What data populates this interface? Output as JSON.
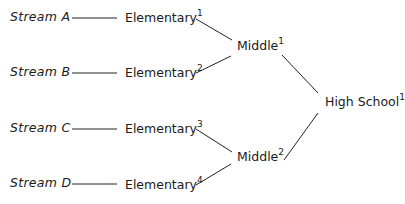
{
  "diagram": {
    "type": "tree",
    "streams": [
      {
        "label": "Stream A"
      },
      {
        "label": "Stream B"
      },
      {
        "label": "Stream C"
      },
      {
        "label": "Stream D"
      }
    ],
    "elementary": [
      {
        "label": "Elementary",
        "sup": "1"
      },
      {
        "label": "Elementary",
        "sup": "2"
      },
      {
        "label": "Elementary",
        "sup": "3"
      },
      {
        "label": "Elementary",
        "sup": "4"
      }
    ],
    "middle": [
      {
        "label": "Middle",
        "sup": "1"
      },
      {
        "label": "Middle",
        "sup": "2"
      }
    ],
    "high": {
      "label": "High School",
      "sup": "1"
    },
    "edges": [
      [
        "Stream A",
        "Elementary1"
      ],
      [
        "Stream B",
        "Elementary2"
      ],
      [
        "Stream C",
        "Elementary3"
      ],
      [
        "Stream D",
        "Elementary4"
      ],
      [
        "Elementary1",
        "Middle1"
      ],
      [
        "Elementary2",
        "Middle1"
      ],
      [
        "Elementary3",
        "Middle2"
      ],
      [
        "Elementary4",
        "Middle2"
      ],
      [
        "Middle1",
        "High School1"
      ],
      [
        "Middle2",
        "High School1"
      ]
    ]
  }
}
